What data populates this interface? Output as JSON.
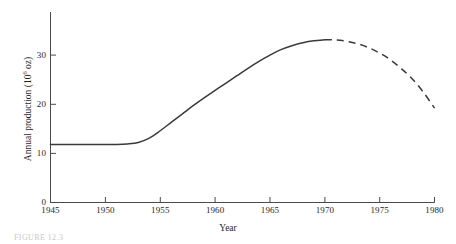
{
  "chart_data": {
    "type": "line",
    "title": "",
    "xlabel": "Year",
    "ylabel": "Annual production (10⁶ oz)",
    "ylabel_base": "Annual production (10",
    "ylabel_exponent": "6",
    "ylabel_tail": " oz)",
    "xlim": [
      1945,
      1980
    ],
    "ylim": [
      0,
      35
    ],
    "xticks": [
      1945,
      1950,
      1955,
      1960,
      1965,
      1970,
      1975,
      1980
    ],
    "xtick_labels": [
      "1945",
      "1950",
      "1955",
      "1960",
      "1965",
      "1970",
      "1975",
      "1980"
    ],
    "yticks": [
      0,
      10,
      20,
      30
    ],
    "ytick_labels": [
      "0",
      "10",
      "20",
      "30"
    ],
    "grid": false,
    "legend": null,
    "series": [
      {
        "name": "Historical annual production",
        "style": "solid",
        "color": "#3a3a3a",
        "x": [
          1945,
          1946,
          1947,
          1948,
          1949,
          1950,
          1951,
          1952,
          1953,
          1954,
          1955,
          1956,
          1957,
          1958,
          1959,
          1960,
          1961,
          1962,
          1963,
          1964,
          1965,
          1966,
          1967,
          1968,
          1969,
          1970
        ],
        "values": [
          11.8,
          11.8,
          11.8,
          11.8,
          11.8,
          11.8,
          11.8,
          11.9,
          12.2,
          13.1,
          14.6,
          16.3,
          18.0,
          19.7,
          21.3,
          22.8,
          24.3,
          25.8,
          27.3,
          28.7,
          30.0,
          31.1,
          31.9,
          32.5,
          32.9,
          33.1
        ]
      },
      {
        "name": "Projected annual production",
        "style": "dashed",
        "color": "#3a3a3a",
        "x": [
          1970,
          1971,
          1972,
          1973,
          1974,
          1975,
          1976,
          1977,
          1978,
          1979,
          1980
        ],
        "values": [
          33.1,
          33.1,
          32.8,
          32.3,
          31.5,
          30.4,
          29.0,
          27.2,
          25.1,
          22.4,
          19.2
        ]
      }
    ],
    "annotations": [
      {
        "text": "peak",
        "x": 1970,
        "y": 33.1
      }
    ]
  },
  "caption": {
    "text": "FIGURE 12.3"
  }
}
